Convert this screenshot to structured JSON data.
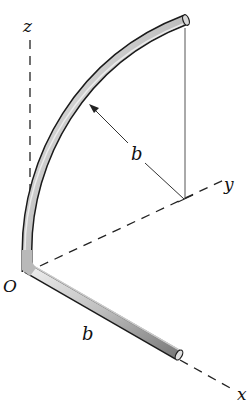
{
  "figure": {
    "type": "3D rod geometry",
    "labels": {
      "z_axis": "z",
      "y_axis": "y",
      "x_axis": "x",
      "origin": "O",
      "radius": "b",
      "rod_length": "b"
    },
    "colors": {
      "rod_fill": "#c8c8c8",
      "rod_outline": "#1a1a1a",
      "axis": "#222222",
      "thin_line": "#555555"
    }
  }
}
